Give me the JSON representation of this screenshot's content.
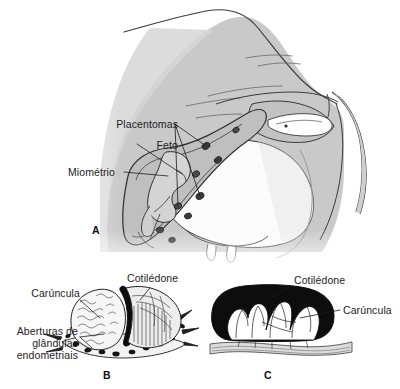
{
  "figure": {
    "background_color": "#ffffff",
    "ink_color": "#1d1d1d",
    "panels": [
      {
        "letter": "A",
        "caption": "Corte sagital do abdome de vaca gestante",
        "labels": [
          {
            "id": "placentomas",
            "text": "Placentomas"
          },
          {
            "id": "feto",
            "text": "Feto"
          },
          {
            "id": "miometrio",
            "text": "Miométrio"
          }
        ]
      },
      {
        "letter": "B",
        "caption": "Placentoma seccionado",
        "labels": [
          {
            "id": "caruncula",
            "text": "Carúncula"
          },
          {
            "id": "cotiledone",
            "text": "Cotilédone"
          },
          {
            "id": "aberturas_l1",
            "text": "Aberturas de"
          },
          {
            "id": "aberturas_l2",
            "text": "glândulas"
          },
          {
            "id": "aberturas_l3",
            "text": "endometriais"
          }
        ]
      },
      {
        "letter": "C",
        "caption": "Corte transversal do placentoma",
        "labels": [
          {
            "id": "cotiledone",
            "text": "Cotilédone"
          },
          {
            "id": "caruncula",
            "text": "Carúncula"
          }
        ]
      }
    ],
    "colors": {
      "line": "#2b2b2b",
      "body_fill": "#c9c9c9",
      "body_fill_light": "#e2e2e2",
      "uterus_fill": "#b6b6b6",
      "placentoma_fill": "#3a3a3a",
      "caruncle_black": "#111111",
      "white": "#ffffff"
    }
  }
}
